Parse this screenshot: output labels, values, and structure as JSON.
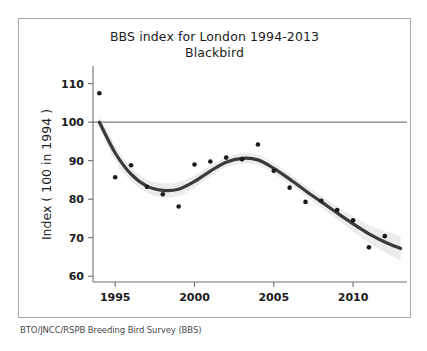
{
  "figure": {
    "title_line1": "BBS index for London 1994-2013",
    "title_line2": "Blackbird",
    "y_axis_label": "Index ( 100 in 1994 )",
    "source_caption": "BTO/JNCC/RSPB Breeding Bird Survey (BBS)",
    "frame_color": "#a9a9a9",
    "background_color": "#ffffff"
  },
  "chart_data": {
    "type": "scatter",
    "subtitle": "Blackbird",
    "xlabel": "",
    "ylabel": "Index ( 100 in 1994 )",
    "xlim": [
      1993.6,
      2013.4
    ],
    "ylim": [
      58.5,
      112.5
    ],
    "grid": false,
    "legend": "none",
    "x_ticks": [
      1995,
      2000,
      2005,
      2010
    ],
    "x_tick_labels": [
      "1995",
      "2000",
      "2005",
      "2010"
    ],
    "y_ticks": [
      60,
      70,
      80,
      90,
      100,
      110
    ],
    "y_tick_labels": [
      "60",
      "70",
      "80",
      "90",
      "100",
      "110"
    ],
    "x": [
      1994,
      1995,
      1996,
      1997,
      1998,
      1999,
      2000,
      2001,
      2002,
      2003,
      2004,
      2005,
      2006,
      2007,
      2008,
      2009,
      2010,
      2011,
      2012
    ],
    "values": [
      107.5,
      85.7,
      88.8,
      83.2,
      81.3,
      78.1,
      89.0,
      89.8,
      90.8,
      90.4,
      94.2,
      87.4,
      83.0,
      79.3,
      79.6,
      77.2,
      74.5,
      67.5,
      70.4
    ],
    "series": [
      {
        "name": "Annual index (points)",
        "type": "scatter",
        "marker_color": "#1b1b1b",
        "x": [
          1994,
          1995,
          1996,
          1997,
          1998,
          1999,
          2000,
          2001,
          2002,
          2003,
          2004,
          2005,
          2006,
          2007,
          2008,
          2009,
          2010,
          2011,
          2012
        ],
        "values": [
          107.5,
          85.7,
          88.8,
          83.2,
          81.3,
          78.1,
          89.0,
          89.8,
          90.8,
          90.4,
          94.2,
          87.4,
          83.0,
          79.3,
          79.6,
          77.2,
          74.5,
          67.5,
          70.4
        ]
      },
      {
        "name": "Smoothed trend",
        "type": "line",
        "line_color": "#3a3a3a",
        "x": [
          1994,
          1995,
          1996,
          1997,
          1998,
          1999,
          2000,
          2001,
          2002,
          2003,
          2004,
          2005,
          2006,
          2007,
          2008,
          2009,
          2010,
          2011,
          2012,
          2013
        ],
        "values": [
          100.0,
          92.0,
          86.5,
          83.4,
          82.3,
          82.6,
          84.6,
          87.3,
          89.6,
          90.6,
          90.2,
          88.0,
          85.2,
          82.2,
          79.3,
          76.4,
          73.6,
          71.0,
          68.9,
          67.2
        ]
      },
      {
        "name": "95% confidence band",
        "type": "band",
        "fill_color": "#ebebeb",
        "x": [
          1994,
          1995,
          1996,
          1997,
          1998,
          1999,
          2000,
          2001,
          2002,
          2003,
          2004,
          2005,
          2006,
          2007,
          2008,
          2009,
          2010,
          2011,
          2012,
          2013
        ],
        "upper": [
          101.5,
          94.0,
          88.3,
          85.1,
          84.2,
          84.4,
          86.2,
          88.7,
          90.9,
          92.0,
          91.6,
          89.4,
          86.6,
          83.6,
          80.8,
          78.1,
          75.6,
          73.3,
          71.6,
          70.4
        ],
        "lower": [
          98.5,
          90.0,
          84.7,
          81.7,
          80.4,
          80.8,
          83.0,
          85.9,
          88.3,
          89.2,
          88.8,
          86.6,
          83.8,
          80.8,
          77.8,
          74.7,
          71.6,
          68.7,
          66.2,
          64.0
        ]
      }
    ],
    "reference_line": {
      "name": "baseline-100",
      "y": 100,
      "color": "#808080",
      "label": ""
    },
    "annotations": []
  }
}
